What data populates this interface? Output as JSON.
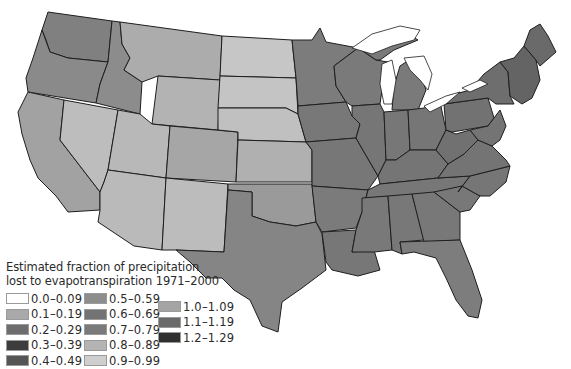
{
  "legend": {
    "title_line1": "Estimated fraction of precipitation",
    "title_line2": "lost to evapotranspiration 1971–2000",
    "columns": [
      [
        {
          "label": "0.0–0.09",
          "color": "#ffffff"
        },
        {
          "label": "0.1–0.19",
          "color": "#a9a9a9"
        },
        {
          "label": "0.2–0.29",
          "color": "#6e6e6e"
        },
        {
          "label": "0.3–0.39",
          "color": "#3c3c3c"
        },
        {
          "label": "0.4–0.49",
          "color": "#555555"
        }
      ],
      [
        {
          "label": "0.5–0.59",
          "color": "#8d8d8d"
        },
        {
          "label": "0.6–0.69",
          "color": "#737373"
        },
        {
          "label": "0.7–0.79",
          "color": "#7a7a7a"
        },
        {
          "label": "0.8–0.89",
          "color": "#b4b4b4"
        },
        {
          "label": "0.9–0.99",
          "color": "#cfcfcf"
        }
      ],
      [
        {
          "label": "1.0–1.09",
          "color": "#a4a4a4"
        },
        {
          "label": "1.1–1.19",
          "color": "#6a6a6a"
        },
        {
          "label": "1.2–1.29",
          "color": "#303030"
        }
      ]
    ]
  },
  "map": {
    "region": "Contiguous United States",
    "state_fills": {
      "WA": "#808080",
      "OR": "#8a8a8a",
      "CA": "#a2a2a2",
      "NV": "#bdbdbd",
      "ID": "#8c8c8c",
      "MT": "#acacac",
      "WY": "#b3b3b3",
      "UT": "#b8b8b8",
      "AZ": "#bababa",
      "CO": "#a6a6a6",
      "NM": "#bcbcbc",
      "ND": "#c6c6c6",
      "SD": "#c4c4c4",
      "NE": "#c0c0c0",
      "KS": "#b0b0b0",
      "OK": "#9a9a9a",
      "TX": "#858585",
      "MN": "#7c7c7c",
      "IA": "#787878",
      "MO": "#777777",
      "AR": "#7b7b7b",
      "LA": "#777777",
      "WI": "#7a7a7a",
      "IL": "#767676",
      "MI": "#7a7a7a",
      "IN": "#777777",
      "OH": "#767676",
      "KY": "#757575",
      "TN": "#777777",
      "MS": "#797979",
      "AL": "#787878",
      "GA": "#787878",
      "FL": "#7d7d7d",
      "SC": "#787878",
      "NC": "#767676",
      "VA": "#747474",
      "WV": "#717171",
      "PA": "#727272",
      "NY": "#6e6e6e",
      "NE_states": "#646464",
      "ME": "#6a6a6a"
    }
  }
}
